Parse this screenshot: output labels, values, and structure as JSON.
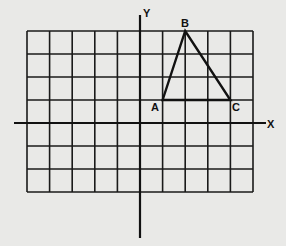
{
  "diagram": {
    "type": "coordinate-grid",
    "axes": {
      "x_label": "X",
      "y_label": "Y"
    },
    "grid": {
      "x_min": -5,
      "x_max": 5,
      "y_min": -3,
      "y_max": 4
    },
    "points": [
      {
        "label": "A",
        "x": 1,
        "y": 1
      },
      {
        "label": "B",
        "x": 2,
        "y": 4
      },
      {
        "label": "C",
        "x": 4,
        "y": 1
      }
    ],
    "shape": "triangle ABC",
    "colors": {
      "background": "#e9e9e7",
      "ink": "#111111"
    }
  }
}
